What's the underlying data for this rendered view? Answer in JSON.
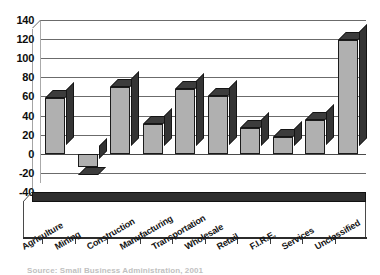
{
  "chart_data": {
    "type": "bar",
    "title": "",
    "subtitle": "",
    "xlabel": "",
    "ylabel": "",
    "categories": [
      "Agriculture",
      "Mining",
      "Construction",
      "Manufacturing",
      "Transportation",
      "Wholesale",
      "Retail",
      "F.I.R.E.",
      "Services",
      "Unclassified"
    ],
    "values": [
      58,
      -14,
      70,
      31,
      68,
      60,
      27,
      18,
      35,
      119
    ],
    "ylim": [
      -40,
      140
    ],
    "ytick_step": 20,
    "yticks": [
      "140",
      "120",
      "100",
      "80",
      "60",
      "40",
      "20",
      "0",
      "-20",
      "-40"
    ],
    "ytick_values": [
      140,
      120,
      100,
      80,
      60,
      40,
      20,
      0,
      -20,
      -40
    ],
    "grid": true,
    "grid_axis": "y",
    "legend": false,
    "legend_position": "none",
    "style": "3d-bar",
    "annotations": []
  },
  "caption": {
    "text": "Source: Small Business Administration, 2001",
    "truncated": true
  },
  "colors": {
    "bar_face": "#b0b0b0",
    "bar_shade": "#343434",
    "grid": "#6b6b6b",
    "axis": "#2b2b2b",
    "text": "#131313",
    "floor": "#2e2e2e"
  }
}
